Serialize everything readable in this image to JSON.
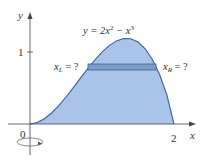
{
  "diagram": {
    "equation": "y = 2x² − x³",
    "equation_parts": {
      "lhs": "y = 2x",
      "sup1": "2",
      "mid": " − x",
      "sup2": "3"
    },
    "axes": {
      "x_label": "x",
      "y_label": "y"
    },
    "ticks": {
      "origin": "0",
      "x_tick": "2",
      "y_tick": "1"
    },
    "strip_labels": {
      "left": {
        "var": "x",
        "sub": "L",
        "rest": " = ?"
      },
      "right": {
        "var": "x",
        "sub": "R",
        "rest": " = ?"
      }
    },
    "colors": {
      "fill": "#a9c4e8",
      "curve": "#3a5f9a",
      "strip": "#7f9cc8",
      "axis": "#444444"
    }
  }
}
